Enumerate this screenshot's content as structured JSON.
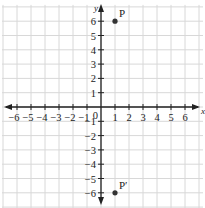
{
  "figure": {
    "type": "coordinate-plane",
    "clipped_caption": "",
    "axes": {
      "x_label": "x",
      "y_label": "y",
      "x_ticks": [
        "-6",
        "-5",
        "-4",
        "-3",
        "-2",
        "-1",
        "1",
        "2",
        "3",
        "4",
        "5",
        "6"
      ],
      "y_ticks": [
        "6",
        "5",
        "4",
        "3",
        "2",
        "1",
        "-1",
        "-2",
        "-3",
        "-4",
        "-5",
        "-6"
      ],
      "origin_label": "0",
      "range": {
        "x": [
          -7,
          7
        ],
        "y": [
          -7,
          7
        ]
      }
    },
    "points": [
      {
        "label": "P",
        "x": 1,
        "y": 6
      },
      {
        "label": "P′",
        "x": 1,
        "y": -6
      }
    ],
    "colors": {
      "grid": "#d8d8d8",
      "axis": "#222222",
      "point": "#333333"
    }
  }
}
